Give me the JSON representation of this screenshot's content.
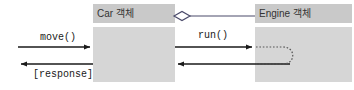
{
  "diagram": {
    "kind": "uml-collaboration-sequence-diagram",
    "background_color": "#ffffff",
    "objects": [
      {
        "id": "car",
        "label": "Car 객체",
        "header_color": "#c9c9c9",
        "body_color": "#d6d6d6",
        "x": 93,
        "y": 4,
        "width": 82,
        "height": 78
      },
      {
        "id": "engine",
        "label": "Engine 객체",
        "header_color": "#c9c9c9",
        "body_color": "#d6d6d6",
        "x": 255,
        "y": 4,
        "width": 97,
        "height": 78
      }
    ],
    "relationship": {
      "type": "aggregation",
      "marker": "hollow-diamond",
      "from": "car",
      "to": "engine",
      "line_color": "#4a4a6a"
    },
    "messages": [
      {
        "id": "move",
        "label": "move()",
        "direction": "right",
        "from": "actor",
        "to": "car",
        "style": "solid-arrow"
      },
      {
        "id": "response",
        "label": "[response]",
        "direction": "left",
        "from": "car",
        "to": "actor",
        "style": "solid-arrow"
      },
      {
        "id": "run",
        "label": "run()",
        "direction": "right",
        "from": "car",
        "to": "engine",
        "style": "solid-arrow"
      },
      {
        "id": "run-return",
        "label": "",
        "direction": "left",
        "from": "engine",
        "to": "car",
        "style": "solid-arrow"
      },
      {
        "id": "engine-self-call",
        "label": "",
        "direction": "self",
        "from": "engine",
        "to": "engine",
        "style": "dotted-loop"
      }
    ],
    "colors": {
      "arrow": "#1a1a1a",
      "header_fill": "#c9c9c9",
      "body_fill": "#d6d6d6",
      "text": "#333333",
      "link": "#4a4a6a",
      "dotted_loop": "#555555"
    }
  }
}
